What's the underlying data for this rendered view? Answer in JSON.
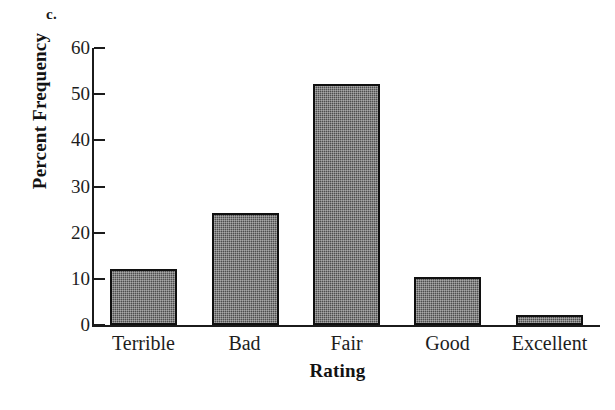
{
  "panel": {
    "label": "c."
  },
  "chart_data": {
    "type": "bar",
    "title": "",
    "subtitle": "",
    "xlabel": "Rating",
    "ylabel": "Percent Frequency",
    "categories": [
      "Terrible",
      "Bad",
      "Fair",
      "Good",
      "Excellent"
    ],
    "values": [
      12.2,
      24.3,
      52.2,
      10.4,
      2.2
    ],
    "series": [
      {
        "name": "Percent Frequency",
        "values": [
          12.2,
          24.3,
          52.2,
          10.4,
          2.2
        ]
      }
    ],
    "ylim": [
      0,
      60
    ],
    "yticks": [
      0,
      10,
      20,
      30,
      40,
      50,
      60
    ],
    "ytick_labels": [
      "0",
      "10",
      "20",
      "30",
      "40",
      "50",
      "60"
    ],
    "grid": false,
    "legend": false,
    "legend_position": "none",
    "bar_fill_color": "#4e4e4e",
    "bar_border_color": "#101010",
    "axis_color": "#1b1b1b",
    "background_color": "#ffffff"
  },
  "bleed": {
    "text": ""
  }
}
